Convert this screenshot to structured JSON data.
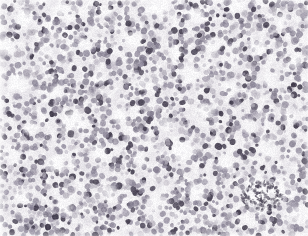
{
  "image": {
    "kind": "histopathology-micrograph",
    "width": 308,
    "height": 236,
    "caption": "",
    "overlay_text": "",
    "scale_bar_label": "",
    "magnification_label": "",
    "stain": "hematoxylin-eosin",
    "background_color": "#fbfafb",
    "nucleus_color_dark": "#4d4758",
    "nucleus_color_mid": "#8a8496",
    "nucleus_color_light": "#b6b1bd",
    "cytoplasm_color": "#e6e3e8",
    "lumen_color": "#fbfbfc",
    "stroma_color": "#d9d6dd",
    "tissue_tint": "#efedf1"
  },
  "field": {
    "nucleus_count": 2600,
    "nucleus_radius_min": 1.5,
    "nucleus_radius_max": 3.4,
    "seed": 20240517,
    "lumens": [
      {
        "cx": 24,
        "cy": 18,
        "rx": 11,
        "ry": 8,
        "rot": -20,
        "strength": 0.92
      },
      {
        "cx": 63,
        "cy": 9,
        "rx": 9,
        "ry": 6,
        "rot": 10,
        "strength": 0.8
      },
      {
        "cx": 106,
        "cy": 12,
        "rx": 8,
        "ry": 6,
        "rot": 0,
        "strength": 0.72
      },
      {
        "cx": 158,
        "cy": 7,
        "rx": 13,
        "ry": 7,
        "rot": -8,
        "strength": 0.88
      },
      {
        "cx": 196,
        "cy": 16,
        "rx": 10,
        "ry": 7,
        "rot": 15,
        "strength": 0.78
      },
      {
        "cx": 238,
        "cy": 6,
        "rx": 11,
        "ry": 6,
        "rot": 0,
        "strength": 0.7
      },
      {
        "cx": 282,
        "cy": 20,
        "rx": 9,
        "ry": 7,
        "rot": -12,
        "strength": 0.74
      },
      {
        "cx": 8,
        "cy": 46,
        "rx": 8,
        "ry": 12,
        "rot": 0,
        "strength": 0.8
      },
      {
        "cx": 46,
        "cy": 52,
        "rx": 10,
        "ry": 7,
        "rot": 25,
        "strength": 0.72
      },
      {
        "cx": 86,
        "cy": 44,
        "rx": 9,
        "ry": 6,
        "rot": -15,
        "strength": 0.66
      },
      {
        "cx": 132,
        "cy": 40,
        "rx": 11,
        "ry": 7,
        "rot": 5,
        "strength": 0.7
      },
      {
        "cx": 176,
        "cy": 52,
        "rx": 8,
        "ry": 6,
        "rot": 0,
        "strength": 0.62
      },
      {
        "cx": 214,
        "cy": 44,
        "rx": 10,
        "ry": 7,
        "rot": -20,
        "strength": 0.68
      },
      {
        "cx": 258,
        "cy": 48,
        "rx": 9,
        "ry": 7,
        "rot": 18,
        "strength": 0.66
      },
      {
        "cx": 296,
        "cy": 60,
        "rx": 10,
        "ry": 8,
        "rot": 0,
        "strength": 0.7
      },
      {
        "cx": 18,
        "cy": 84,
        "rx": 12,
        "ry": 9,
        "rot": -10,
        "strength": 0.86
      },
      {
        "cx": 58,
        "cy": 92,
        "rx": 9,
        "ry": 7,
        "rot": 20,
        "strength": 0.64
      },
      {
        "cx": 100,
        "cy": 78,
        "rx": 8,
        "ry": 6,
        "rot": 0,
        "strength": 0.6
      },
      {
        "cx": 144,
        "cy": 84,
        "rx": 9,
        "ry": 7,
        "rot": -18,
        "strength": 0.64
      },
      {
        "cx": 188,
        "cy": 74,
        "rx": 11,
        "ry": 8,
        "rot": 8,
        "strength": 0.72
      },
      {
        "cx": 232,
        "cy": 88,
        "rx": 9,
        "ry": 7,
        "rot": 0,
        "strength": 0.62
      },
      {
        "cx": 272,
        "cy": 80,
        "rx": 10,
        "ry": 7,
        "rot": 14,
        "strength": 0.66
      },
      {
        "cx": 74,
        "cy": 120,
        "rx": 13,
        "ry": 10,
        "rot": -12,
        "strength": 0.9
      },
      {
        "cx": 30,
        "cy": 128,
        "rx": 9,
        "ry": 7,
        "rot": 0,
        "strength": 0.7
      },
      {
        "cx": 120,
        "cy": 116,
        "rx": 10,
        "ry": 8,
        "rot": 16,
        "strength": 0.74
      },
      {
        "cx": 166,
        "cy": 124,
        "rx": 9,
        "ry": 7,
        "rot": 0,
        "strength": 0.66
      },
      {
        "cx": 206,
        "cy": 112,
        "rx": 11,
        "ry": 8,
        "rot": -14,
        "strength": 0.76
      },
      {
        "cx": 250,
        "cy": 126,
        "rx": 10,
        "ry": 8,
        "rot": 6,
        "strength": 0.72
      },
      {
        "cx": 292,
        "cy": 118,
        "rx": 9,
        "ry": 7,
        "rot": 0,
        "strength": 0.64
      },
      {
        "cx": 14,
        "cy": 158,
        "rx": 10,
        "ry": 8,
        "rot": 0,
        "strength": 0.72
      },
      {
        "cx": 56,
        "cy": 164,
        "rx": 11,
        "ry": 9,
        "rot": -16,
        "strength": 0.8
      },
      {
        "cx": 98,
        "cy": 152,
        "rx": 10,
        "ry": 8,
        "rot": 10,
        "strength": 0.76
      },
      {
        "cx": 140,
        "cy": 160,
        "rx": 9,
        "ry": 7,
        "rot": 0,
        "strength": 0.68
      },
      {
        "cx": 182,
        "cy": 150,
        "rx": 12,
        "ry": 9,
        "rot": -8,
        "strength": 0.82
      },
      {
        "cx": 226,
        "cy": 162,
        "rx": 10,
        "ry": 8,
        "rot": 12,
        "strength": 0.74
      },
      {
        "cx": 268,
        "cy": 148,
        "rx": 11,
        "ry": 9,
        "rot": 0,
        "strength": 0.78
      },
      {
        "cx": 22,
        "cy": 198,
        "rx": 10,
        "ry": 8,
        "rot": 0,
        "strength": 0.7
      },
      {
        "cx": 66,
        "cy": 206,
        "rx": 9,
        "ry": 7,
        "rot": -18,
        "strength": 0.66
      },
      {
        "cx": 110,
        "cy": 194,
        "rx": 11,
        "ry": 8,
        "rot": 8,
        "strength": 0.74
      },
      {
        "cx": 152,
        "cy": 204,
        "rx": 9,
        "ry": 7,
        "rot": 0,
        "strength": 0.64
      },
      {
        "cx": 196,
        "cy": 192,
        "rx": 10,
        "ry": 8,
        "rot": 15,
        "strength": 0.7
      },
      {
        "cx": 262,
        "cy": 196,
        "rx": 22,
        "ry": 16,
        "rot": -8,
        "strength": 0.94
      },
      {
        "cx": 300,
        "cy": 214,
        "rx": 10,
        "ry": 9,
        "rot": 0,
        "strength": 0.72
      }
    ],
    "pale_bands": [
      {
        "x": 0,
        "y": 0,
        "w": 96,
        "h": 70,
        "rot": -18,
        "alpha": 0.3
      },
      {
        "x": 120,
        "y": 0,
        "w": 120,
        "h": 26,
        "rot": -6,
        "alpha": 0.26
      },
      {
        "x": 0,
        "y": 96,
        "w": 70,
        "h": 26,
        "rot": 12,
        "alpha": 0.22
      },
      {
        "x": 236,
        "y": 168,
        "w": 80,
        "h": 52,
        "rot": -10,
        "alpha": 0.34
      },
      {
        "x": 196,
        "y": 212,
        "w": 120,
        "h": 30,
        "rot": 4,
        "alpha": 0.24
      }
    ]
  },
  "regions": [
    {
      "name": "upper-left-stroma",
      "note": "paler loose tissue, sparser nuclei"
    },
    {
      "name": "central-tumor-sheet",
      "note": "dense small round blue cells"
    },
    {
      "name": "rosette-zone-lower",
      "note": "numerous pale lumens ringed by nuclei"
    },
    {
      "name": "lower-right-gland",
      "note": "large pale lumen with dark debris"
    }
  ]
}
